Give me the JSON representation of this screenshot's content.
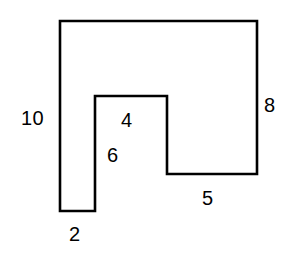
{
  "figure": {
    "stroke_color": "#000000",
    "fill_color": "#ffffff",
    "background_color": "#ffffff",
    "stroke_width": 2.6,
    "outline_points": "60,21 257,21 257,174 167,174 167,96 95,96 95,211 60,211",
    "labels": {
      "left_side": "10",
      "right_side": "8",
      "inner_top": "4",
      "inner_left": "6",
      "bottom_right": "5",
      "bottom_left": "2"
    }
  }
}
